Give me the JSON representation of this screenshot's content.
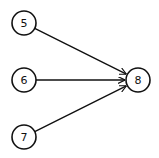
{
  "diagram": {
    "type": "directed-graph",
    "nodes": [
      {
        "id": "5",
        "label": "5",
        "cx": 24,
        "cy": 23
      },
      {
        "id": "6",
        "label": "6",
        "cx": 24,
        "cy": 80
      },
      {
        "id": "7",
        "label": "7",
        "cx": 24,
        "cy": 137
      },
      {
        "id": "8",
        "label": "8",
        "cx": 138,
        "cy": 80
      }
    ],
    "edges": [
      {
        "from": "5",
        "to": "8"
      },
      {
        "from": "6",
        "to": "8"
      },
      {
        "from": "7",
        "to": "8"
      }
    ],
    "node_radius": 12,
    "colors": {
      "stroke": "#111111",
      "fill": "#ffffff"
    }
  }
}
